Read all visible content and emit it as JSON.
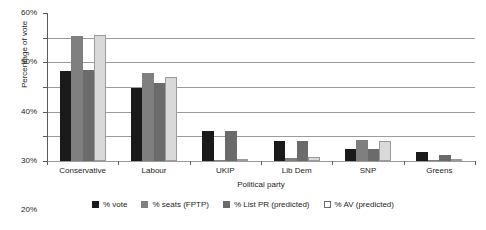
{
  "chart_data": {
    "type": "bar",
    "title": "",
    "xlabel": "Political party",
    "ylabel": "Percentage of vote",
    "categories": [
      "Conservative",
      "Labour",
      "UKIP",
      "Lib Dem",
      "SNP",
      "Greens"
    ],
    "ylim": [
      0,
      60
    ],
    "ytick_labels": [
      "0%",
      "10%",
      "20%",
      "30%",
      "40%",
      "50%",
      "60%"
    ],
    "ytick_values": [
      0,
      10,
      20,
      30,
      40,
      50,
      60
    ],
    "grid": "horizontal",
    "legend_position": "bottom",
    "series": [
      {
        "name": "% vote",
        "color": "#1a1a1a",
        "values": [
          36.5,
          29.5,
          12.0,
          8.0,
          4.7,
          3.8
        ]
      },
      {
        "name": "% seats (FPTP)",
        "color": "#7f7f7f",
        "values": [
          50.5,
          35.5,
          0.2,
          1.2,
          8.6,
          0.2
        ]
      },
      {
        "name": "% List PR (predicted)",
        "color": "#6b6b6b",
        "values": [
          37.0,
          31.5,
          12.0,
          8.0,
          5.0,
          2.5
        ]
      },
      {
        "name": "% AV (predicted)",
        "color": "#d9d9d9",
        "values": [
          51.0,
          34.0,
          0.5,
          1.5,
          8.0,
          0.3
        ]
      }
    ]
  },
  "axes": {
    "y_title": "Percentage of vote",
    "x_title": "Political party"
  }
}
